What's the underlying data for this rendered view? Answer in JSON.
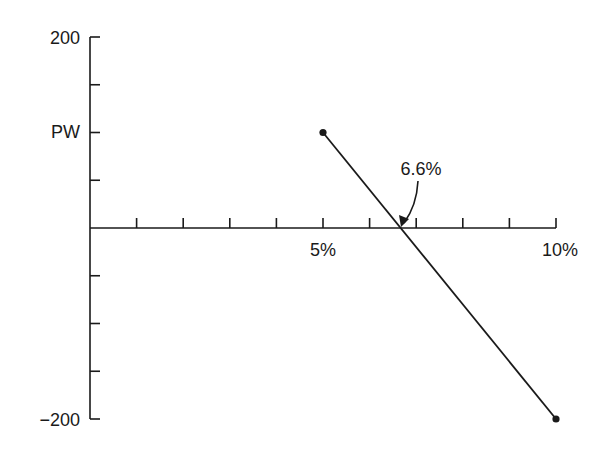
{
  "chart_data": {
    "type": "line",
    "title": "",
    "xlabel": "",
    "ylabel": "PW",
    "xlim": [
      0,
      10
    ],
    "ylim": [
      -200,
      200
    ],
    "x_ticks": [
      1,
      2,
      3,
      4,
      5,
      6,
      7,
      8,
      9,
      10
    ],
    "x_tick_labels": {
      "5": "5%",
      "10": "10%"
    },
    "y_ticks": [
      -200,
      -150,
      -100,
      -50,
      0,
      50,
      100,
      150,
      200
    ],
    "y_tick_labels": {
      "200": "200",
      "-200": "−200",
      "100": "PW"
    },
    "grid": false,
    "legend": null,
    "series": [
      {
        "name": "PW",
        "x": [
          5,
          10
        ],
        "y": [
          100,
          -200
        ],
        "markers": true
      }
    ],
    "annotations": [
      {
        "text": "6.6%",
        "points_to": {
          "x": 6.6,
          "y": 0
        },
        "arrow": true
      }
    ]
  },
  "labels": {
    "y_top": "200",
    "y_bottom": "−200",
    "y_axis_name": "PW",
    "x_5": "5%",
    "x_10": "10%",
    "annotation": "6.6%"
  }
}
